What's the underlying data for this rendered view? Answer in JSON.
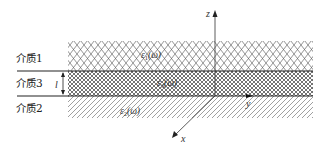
{
  "diagram": {
    "type": "layered-dielectric-cross-section",
    "media": [
      {
        "id": "medium-1",
        "label": "介质1",
        "permittivity": {
          "symbol": "ε",
          "subscript": "1",
          "arg": "(ω)"
        },
        "fill": "diamond-crosshatch"
      },
      {
        "id": "medium-3",
        "label": "介质3",
        "permittivity": {
          "symbol": "ε",
          "subscript": "3",
          "arg": "(ω)"
        },
        "fill": "dense-crosshatch"
      },
      {
        "id": "medium-2",
        "label": "介质2",
        "permittivity": {
          "symbol": "ε",
          "subscript": "2",
          "arg": "(ω)"
        },
        "fill": "diagonal-hatch"
      }
    ],
    "thickness_label": "l",
    "axes": {
      "z": "z",
      "y": "y",
      "x": "x"
    },
    "colors": {
      "line": "#222222",
      "hatch": "#555555",
      "background": "#ffffff"
    }
  }
}
